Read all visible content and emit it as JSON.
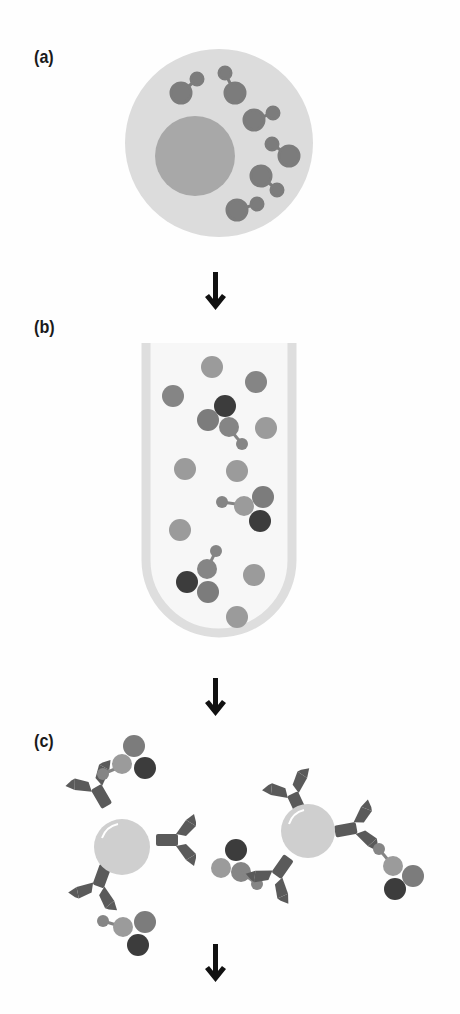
{
  "panels": [
    {
      "id": "a",
      "label": "(a)",
      "description": "Cell containing nucleus and bound molecule complexes"
    },
    {
      "id": "b",
      "label": "(b)",
      "description": "Test tube with lysate containing free proteins and complexes"
    },
    {
      "id": "c",
      "label": "(c)",
      "description": "Antibody-coated beads capturing protein complexes"
    }
  ],
  "colors": {
    "cell": "#dcdcdc",
    "nucleus": "#a8a8a8",
    "molecule": "#7c7c7c",
    "protein_light": "#9b9b9b",
    "protein_mid": "#858585",
    "protein_dark": "#3c3c3c",
    "tube": "#dedede",
    "antibody": "#5a5a5a",
    "bead": "#cfcfcf",
    "arrow": "#111111"
  },
  "arrows": [
    {
      "name": "arrow-a-to-b",
      "x": 215,
      "y": 268
    },
    {
      "name": "arrow-b-to-c",
      "x": 215,
      "y": 676
    },
    {
      "name": "arrow-c-to-next",
      "x": 215,
      "y": 942
    }
  ]
}
